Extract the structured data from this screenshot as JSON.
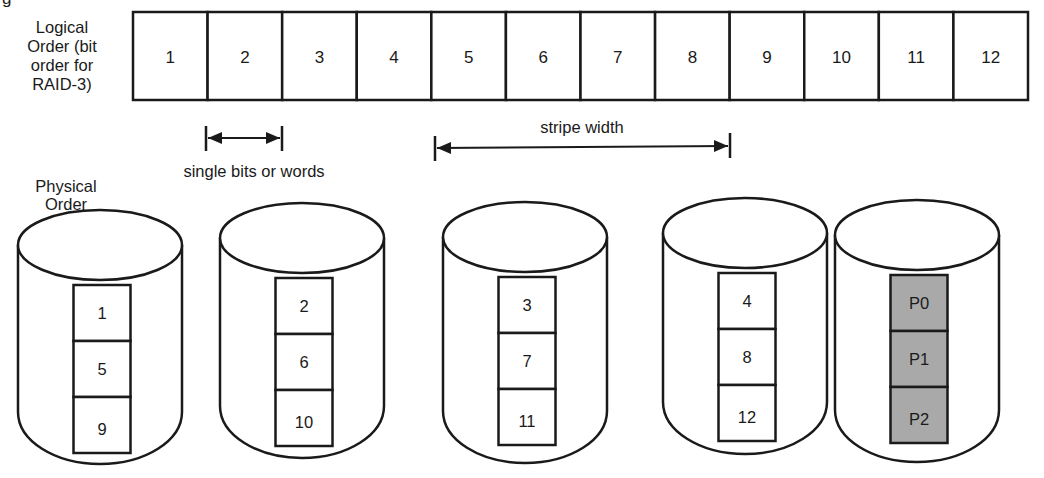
{
  "diagram": {
    "title_fragment": "g",
    "logical_order": {
      "label_lines": [
        "Logical",
        "Order (bit",
        "order for",
        "RAID-3)"
      ],
      "cells": [
        "1",
        "2",
        "3",
        "4",
        "5",
        "6",
        "7",
        "8",
        "9",
        "10",
        "11",
        "12"
      ]
    },
    "annotations": {
      "single_unit": "single bits or words",
      "stripe_width": "stripe width"
    },
    "physical_order": {
      "label_lines": [
        "Physical",
        "Order"
      ],
      "disks": [
        {
          "name": "disk-1",
          "blocks": [
            "1",
            "5",
            "9"
          ],
          "parity": false
        },
        {
          "name": "disk-2",
          "blocks": [
            "2",
            "6",
            "10"
          ],
          "parity": false
        },
        {
          "name": "disk-3",
          "blocks": [
            "3",
            "7",
            "11"
          ],
          "parity": false
        },
        {
          "name": "disk-4",
          "blocks": [
            "4",
            "8",
            "12"
          ],
          "parity": false
        },
        {
          "name": "parity-disk",
          "blocks": [
            "P0",
            "P1",
            "P2"
          ],
          "parity": true
        }
      ]
    },
    "colors": {
      "stroke": "#1a1a1a",
      "data_block_fill": "#ffffff",
      "parity_block_fill": "#a9a9a9"
    }
  }
}
